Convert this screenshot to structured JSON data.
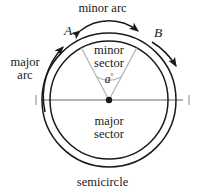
{
  "diagram": {
    "labels": {
      "minor_arc": "minor arc",
      "major_arc_line1": "major",
      "major_arc_line2": "arc",
      "minor_sector_line1": "minor",
      "minor_sector_line2": "sector",
      "major_sector_line1": "major",
      "major_sector_line2": "sector",
      "semicircle": "semicircle",
      "point_a": "A",
      "point_b": "B",
      "angle_value": "a",
      "angle_unit": "°"
    },
    "colors": {
      "stroke": "#1a1a1a",
      "radius_line": "#b4b4b4",
      "diameter_line": "#9a9a9a",
      "background": "#ffffff"
    },
    "geometry": {
      "center_x": 109,
      "center_y": 100,
      "inner_radius": 59,
      "outer_radius": 67,
      "angle_a_deg": 118,
      "angle_b_deg": 62
    }
  }
}
